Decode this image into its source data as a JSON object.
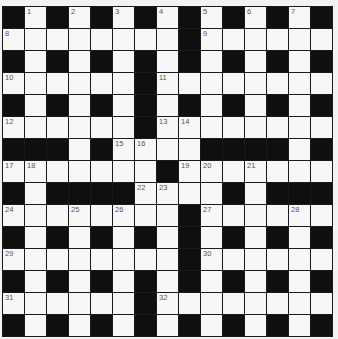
{
  "puzzle": {
    "rows": 15,
    "cols": 15,
    "grid": [
      "#.#.#.#.#.#.#.#",
      "........#......",
      "#.#.#.#.#.#.#.#",
      "......#........",
      "#.#.#.#.#.#.#.#",
      "......#........",
      "###.#....####.#",
      ".......#.......",
      "#.####....#.###",
      "........#......",
      "#.#.#.#.#.#.#.#",
      "........#......",
      "#.#.#.#.#.#.#.#",
      "......#........",
      "#.#.#.#.#.#.#.#"
    ],
    "numbers": [
      {
        "n": "1",
        "r": 0,
        "c": 1
      },
      {
        "n": "2",
        "r": 0,
        "c": 3
      },
      {
        "n": "3",
        "r": 0,
        "c": 5
      },
      {
        "n": "4",
        "r": 0,
        "c": 7
      },
      {
        "n": "5",
        "r": 0,
        "c": 9
      },
      {
        "n": "6",
        "r": 0,
        "c": 11
      },
      {
        "n": "7",
        "r": 0,
        "c": 13
      },
      {
        "n": "8",
        "r": 1,
        "c": 0
      },
      {
        "n": "9",
        "r": 1,
        "c": 9
      },
      {
        "n": "10",
        "r": 3,
        "c": 0
      },
      {
        "n": "11",
        "r": 3,
        "c": 7
      },
      {
        "n": "12",
        "r": 5,
        "c": 0
      },
      {
        "n": "13",
        "r": 5,
        "c": 7
      },
      {
        "n": "14",
        "r": 5,
        "c": 8
      },
      {
        "n": "15",
        "r": 6,
        "c": 5
      },
      {
        "n": "16",
        "r": 6,
        "c": 6
      },
      {
        "n": "17",
        "r": 7,
        "c": 0
      },
      {
        "n": "18",
        "r": 7,
        "c": 1
      },
      {
        "n": "19",
        "r": 7,
        "c": 8
      },
      {
        "n": "20",
        "r": 7,
        "c": 9
      },
      {
        "n": "21",
        "r": 7,
        "c": 11
      },
      {
        "n": "22",
        "r": 8,
        "c": 6
      },
      {
        "n": "23",
        "r": 8,
        "c": 7
      },
      {
        "n": "24",
        "r": 9,
        "c": 0
      },
      {
        "n": "25",
        "r": 9,
        "c": 3
      },
      {
        "n": "26",
        "r": 9,
        "c": 5
      },
      {
        "n": "27",
        "r": 9,
        "c": 9
      },
      {
        "n": "28",
        "r": 9,
        "c": 13
      },
      {
        "n": "29",
        "r": 11,
        "c": 0
      },
      {
        "n": "30",
        "r": 11,
        "c": 9
      },
      {
        "n": "31",
        "r": 13,
        "c": 0
      },
      {
        "n": "32",
        "r": 13,
        "c": 7
      }
    ],
    "colors": {
      "white_cell": "#f7f7f7",
      "black_cell": "#0f0f0f",
      "grid_line": "#1a1a1a",
      "number_text": "#555555",
      "background": "#f2f2f2"
    }
  }
}
